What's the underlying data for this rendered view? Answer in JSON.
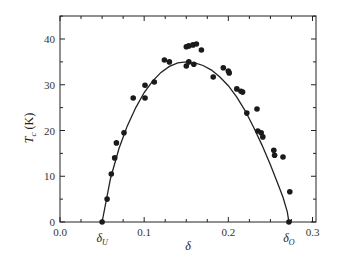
{
  "chart_data": {
    "type": "scatter",
    "title": "",
    "xlabel": "δ",
    "ylabel": "T_c (K)",
    "ylabel_main": "T",
    "ylabel_sub": "c",
    "ylabel_unit": " (K)",
    "xlim": [
      0.0,
      0.3
    ],
    "ylim": [
      0,
      45
    ],
    "x_ticks": [
      0.0,
      0.1,
      0.2,
      0.3
    ],
    "x_tick_labels": [
      "0.0",
      "0.1",
      "0.2",
      "0.3"
    ],
    "x_minor_step": 0.025,
    "y_ticks": [
      0,
      10,
      20,
      30,
      40
    ],
    "y_tick_labels": [
      "0",
      "10",
      "20",
      "30",
      "40"
    ],
    "y_minor_step": 5,
    "grid": false,
    "legend": null,
    "annotations": [
      {
        "text": "δ",
        "sub": "U",
        "x": 0.05,
        "y": 0
      },
      {
        "text": "δ",
        "sub": "O",
        "x": 0.272,
        "y": 0
      }
    ],
    "series": [
      {
        "name": "measured T_c",
        "kind": "scatter",
        "x": [
          0.05,
          0.056,
          0.061,
          0.065,
          0.067,
          0.076,
          0.087,
          0.101,
          0.101,
          0.112,
          0.124,
          0.13,
          0.15,
          0.153,
          0.159,
          0.15,
          0.153,
          0.158,
          0.162,
          0.168,
          0.182,
          0.194,
          0.2,
          0.201,
          0.21,
          0.215,
          0.217,
          0.222,
          0.234,
          0.235,
          0.239,
          0.241,
          0.254,
          0.255,
          0.265,
          0.273,
          0.272
        ],
        "y": [
          0.0,
          5.0,
          10.5,
          14.0,
          17.3,
          19.5,
          27.1,
          27.1,
          29.9,
          30.6,
          35.4,
          35.0,
          34.1,
          35.0,
          34.5,
          38.3,
          38.5,
          38.7,
          38.9,
          37.6,
          31.7,
          33.7,
          33.0,
          32.6,
          29.1,
          28.6,
          28.4,
          23.8,
          24.7,
          19.9,
          19.5,
          18.6,
          15.7,
          14.6,
          14.2,
          6.6,
          0.0
        ]
      },
      {
        "name": "fit curve",
        "kind": "line",
        "x": [
          0.05,
          0.06,
          0.07,
          0.08,
          0.09,
          0.1,
          0.11,
          0.12,
          0.13,
          0.14,
          0.15,
          0.16,
          0.17,
          0.18,
          0.19,
          0.2,
          0.21,
          0.22,
          0.23,
          0.24,
          0.25,
          0.26,
          0.265,
          0.27,
          0.272
        ],
        "y": [
          0.0,
          9.5,
          16.0,
          21.0,
          25.0,
          28.3,
          30.8,
          32.7,
          34.0,
          34.8,
          35.0,
          34.8,
          34.2,
          33.2,
          31.7,
          29.8,
          27.3,
          24.3,
          20.7,
          16.8,
          12.5,
          7.8,
          5.4,
          2.2,
          0.0
        ]
      }
    ]
  }
}
